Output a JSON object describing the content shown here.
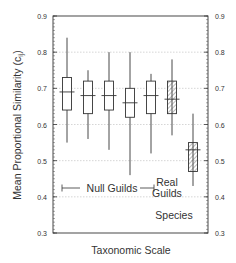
{
  "chart_data": {
    "type": "boxplot",
    "title": "",
    "xlabel": "Taxonomic Scale",
    "ylabel": "Mean Proportional Similarity (c",
    "ylabel_subscript": "ij",
    "ylabel_close": ")",
    "ylim": [
      0.3,
      0.9
    ],
    "yticks": [
      0.3,
      0.4,
      0.5,
      0.6,
      0.7,
      0.8,
      0.9
    ],
    "ytick_labels": [
      "0.3",
      "0.4",
      "0.5",
      "0.6",
      "0.7",
      "0.8",
      "0.9"
    ],
    "minor_tick_step": 0.01,
    "grid": "dotted horizontal at major ticks",
    "right_axis_mirrored": true,
    "categories": [
      "Null Guild 1",
      "Null Guild 2",
      "Null Guild 3",
      "Null Guild 4",
      "Null Guild 5",
      "Real Guilds",
      "Species"
    ],
    "boxes": [
      {
        "group": "Null Guilds",
        "whisker_high": 0.84,
        "q3": 0.73,
        "median": 0.69,
        "q1": 0.64,
        "whisker_low": 0.55,
        "hatched": false
      },
      {
        "group": "Null Guilds",
        "whisker_high": 0.75,
        "q3": 0.72,
        "median": 0.68,
        "q1": 0.63,
        "whisker_low": 0.56,
        "hatched": false
      },
      {
        "group": "Null Guilds",
        "whisker_high": 0.8,
        "q3": 0.72,
        "median": 0.68,
        "q1": 0.64,
        "whisker_low": 0.53,
        "hatched": false
      },
      {
        "group": "Null Guilds",
        "whisker_high": 0.8,
        "q3": 0.7,
        "median": 0.66,
        "q1": 0.62,
        "whisker_low": 0.46,
        "hatched": false
      },
      {
        "group": "Null Guilds",
        "whisker_high": 0.74,
        "q3": 0.72,
        "median": 0.68,
        "q1": 0.63,
        "whisker_low": 0.52,
        "hatched": false
      },
      {
        "group": "Real Guilds",
        "whisker_high": 0.78,
        "q3": 0.72,
        "median": 0.67,
        "q1": 0.63,
        "whisker_low": 0.57,
        "hatched": true
      },
      {
        "group": "Species",
        "whisker_high": 0.63,
        "q3": 0.55,
        "median": 0.53,
        "q1": 0.47,
        "whisker_low": 0.43,
        "hatched": true
      }
    ],
    "annotations": [
      {
        "text": "Null Guilds",
        "type": "bracket"
      },
      {
        "text": "Real",
        "line": 1
      },
      {
        "text": "Guilds",
        "line": 2
      },
      {
        "text": "Species"
      }
    ],
    "legend": null
  }
}
